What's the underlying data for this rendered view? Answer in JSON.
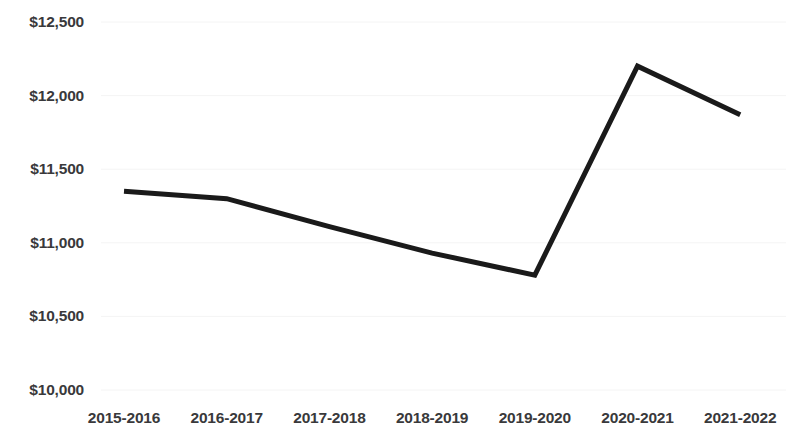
{
  "chart_data": {
    "type": "line",
    "title": "",
    "subtitle": "",
    "xlabel": "",
    "ylabel": "",
    "categories": [
      "2015-2016",
      "2016-2017",
      "2017-2018",
      "2018-2019",
      "2019-2020",
      "2020-2021",
      "2021-2022"
    ],
    "series": [
      {
        "name": "",
        "values": [
          11350,
          11300,
          11110,
          10930,
          10780,
          12200,
          11870
        ],
        "color": "#1a1a1a",
        "line_width": 5
      }
    ],
    "ylim": [
      10000,
      12500
    ],
    "ytick_values": [
      12500,
      12000,
      11500,
      11000,
      10500,
      10000
    ],
    "ytick_labels": [
      "$12,500",
      "$12,000",
      "$11,500",
      "$11,000",
      "$10,500",
      "$10,000"
    ],
    "xtick_labels": [
      "2015-2016",
      "2016-2017",
      "2017-2018",
      "2018-2019",
      "2019-2020",
      "2020-2021",
      "2021-2022"
    ],
    "grid": true,
    "grid_axis": "y",
    "grid_color": "#f4f4f4",
    "legend": false,
    "legend_position": "none",
    "markers": false,
    "annotations": [],
    "background_color": "#ffffff",
    "tick_label_color": "#39393b"
  },
  "layout": {
    "plot_left": 101,
    "plot_right": 786,
    "plot_top": 8,
    "plot_bottom": 398,
    "y_pixel_top": 22,
    "y_pixel_bottom": 390,
    "x_first_center": 124,
    "x_spacing": 102.7,
    "ylabel_right_edge": 78
  }
}
